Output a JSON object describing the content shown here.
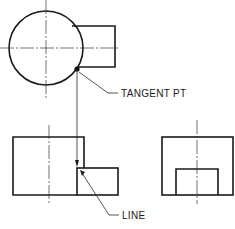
{
  "diagram": {
    "type": "orthographic-projection",
    "views": [
      "top-view",
      "front-view",
      "side-view"
    ],
    "labels": {
      "tangent_point": "TANGENT PT",
      "line": "LINE"
    },
    "colors": {
      "line": "#1a1a1a",
      "background": "#ffffff"
    }
  }
}
